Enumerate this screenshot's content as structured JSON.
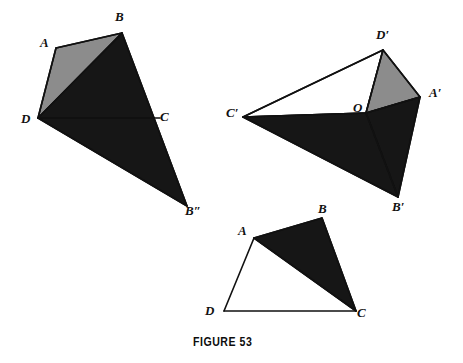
{
  "figure": {
    "caption": "FIGURE  53",
    "caption_position": {
      "x": 193,
      "y": 335
    },
    "colors": {
      "dark_fill": "#161616",
      "gray_fill": "#8c8c8c",
      "white_fill": "#ffffff",
      "stroke": "#111111",
      "background": "#ffffff"
    },
    "stroke_width": 1.6
  },
  "diagrams": [
    {
      "id": "left-unfolded-solid",
      "name": "left-figure",
      "vertices": {
        "A": {
          "x": 56,
          "y": 48
        },
        "B": {
          "x": 122,
          "y": 33
        },
        "C": {
          "x": 154,
          "y": 118
        },
        "D": {
          "x": 38,
          "y": 118
        },
        "Bpp": {
          "x": 187,
          "y": 206
        }
      },
      "faces": [
        {
          "name": "face-ABD-gray",
          "fill": "gray",
          "points": "56,48 122,33 38,118"
        },
        {
          "name": "face-BCD-dark",
          "fill": "dark",
          "points": "122,33 154,118 38,118"
        },
        {
          "name": "face-DCBpp-dark",
          "fill": "dark",
          "points": "38,118 154,118 187,206"
        }
      ],
      "edges": [
        {
          "name": "edge-A-B",
          "x1": 56,
          "y1": 48,
          "x2": 122,
          "y2": 33
        },
        {
          "name": "edge-A-D",
          "x1": 56,
          "y1": 48,
          "x2": 38,
          "y2": 118
        },
        {
          "name": "edge-D-B",
          "x1": 38,
          "y1": 118,
          "x2": 122,
          "y2": 33
        },
        {
          "name": "edge-B-C",
          "x1": 122,
          "y1": 33,
          "x2": 154,
          "y2": 118
        },
        {
          "name": "edge-D-C",
          "x1": 38,
          "y1": 118,
          "x2": 160,
          "y2": 118
        },
        {
          "name": "edge-C-Bpp",
          "x1": 154,
          "y1": 118,
          "x2": 187,
          "y2": 206
        },
        {
          "name": "edge-D-Bpp",
          "x1": 38,
          "y1": 118,
          "x2": 187,
          "y2": 206
        }
      ],
      "labels": [
        {
          "text": "A",
          "x": 40,
          "y": 36,
          "name": "vertex-label-A"
        },
        {
          "text": "B",
          "x": 115,
          "y": 10,
          "name": "vertex-label-B"
        },
        {
          "text": "C",
          "x": 160,
          "y": 110,
          "name": "vertex-label-C"
        },
        {
          "text": "D",
          "x": 21,
          "y": 112,
          "name": "vertex-label-D"
        },
        {
          "text": "B″",
          "x": 185,
          "y": 204,
          "name": "vertex-label-B-double-prime"
        }
      ]
    },
    {
      "id": "right-folded-solid",
      "name": "right-figure",
      "vertices": {
        "Dp": {
          "x": 383,
          "y": 50
        },
        "Ap": {
          "x": 420,
          "y": 97
        },
        "O": {
          "x": 366,
          "y": 113
        },
        "Cp": {
          "x": 243,
          "y": 117
        },
        "Bp": {
          "x": 398,
          "y": 197
        }
      },
      "faces": [
        {
          "name": "face-CpDpO-white",
          "fill": "white",
          "points": "243,117 383,50 366,113"
        },
        {
          "name": "face-DpApO-gray",
          "fill": "gray",
          "points": "383,50 420,97 366,113"
        },
        {
          "name": "face-OApBp-dark",
          "fill": "dark",
          "points": "366,113 420,97 398,197"
        },
        {
          "name": "face-CpOBp-dark",
          "fill": "dark",
          "points": "243,117 366,113 398,197"
        }
      ],
      "edges": [
        {
          "name": "edge-Cp-Dp",
          "x1": 243,
          "y1": 117,
          "x2": 383,
          "y2": 50
        },
        {
          "name": "edge-Dp-Ap",
          "x1": 383,
          "y1": 50,
          "x2": 420,
          "y2": 97
        },
        {
          "name": "edge-Dp-O",
          "x1": 383,
          "y1": 50,
          "x2": 366,
          "y2": 113
        },
        {
          "name": "edge-Cp-O",
          "x1": 243,
          "y1": 117,
          "x2": 366,
          "y2": 113
        },
        {
          "name": "edge-O-Ap",
          "x1": 366,
          "y1": 113,
          "x2": 420,
          "y2": 97
        },
        {
          "name": "edge-Ap-Bp",
          "x1": 420,
          "y1": 97,
          "x2": 398,
          "y2": 197
        },
        {
          "name": "edge-O-Bp",
          "x1": 366,
          "y1": 113,
          "x2": 398,
          "y2": 197
        },
        {
          "name": "edge-Cp-Bp",
          "x1": 243,
          "y1": 117,
          "x2": 398,
          "y2": 197
        }
      ],
      "labels": [
        {
          "text": "D′",
          "x": 376,
          "y": 28,
          "name": "vertex-label-D-prime"
        },
        {
          "text": "A′",
          "x": 429,
          "y": 86,
          "name": "vertex-label-A-prime"
        },
        {
          "text": "O",
          "x": 353,
          "y": 101,
          "name": "vertex-label-O"
        },
        {
          "text": "C′",
          "x": 226,
          "y": 106,
          "name": "vertex-label-C-prime"
        },
        {
          "text": "B′",
          "x": 392,
          "y": 200,
          "name": "vertex-label-B-prime"
        }
      ]
    },
    {
      "id": "bottom-flat-quadrilateral",
      "name": "bottom-figure",
      "vertices": {
        "A": {
          "x": 254,
          "y": 238
        },
        "B": {
          "x": 322,
          "y": 218
        },
        "C": {
          "x": 356,
          "y": 311
        },
        "D": {
          "x": 224,
          "y": 311
        }
      },
      "faces": [
        {
          "name": "face-ABC-dark",
          "fill": "dark",
          "points": "254,238 322,218 356,311"
        }
      ],
      "edges": [
        {
          "name": "edge-A-B",
          "x1": 254,
          "y1": 238,
          "x2": 322,
          "y2": 218
        },
        {
          "name": "edge-B-C",
          "x1": 322,
          "y1": 218,
          "x2": 356,
          "y2": 311
        },
        {
          "name": "edge-A-C",
          "x1": 254,
          "y1": 238,
          "x2": 356,
          "y2": 311
        },
        {
          "name": "edge-A-D",
          "x1": 254,
          "y1": 238,
          "x2": 224,
          "y2": 311
        },
        {
          "name": "edge-D-C",
          "x1": 224,
          "y1": 311,
          "x2": 356,
          "y2": 311
        }
      ],
      "labels": [
        {
          "text": "A",
          "x": 238,
          "y": 224,
          "name": "vertex-label-A"
        },
        {
          "text": "B",
          "x": 318,
          "y": 202,
          "name": "vertex-label-B"
        },
        {
          "text": "C",
          "x": 357,
          "y": 306,
          "name": "vertex-label-C"
        },
        {
          "text": "D",
          "x": 205,
          "y": 304,
          "name": "vertex-label-D"
        }
      ]
    }
  ]
}
